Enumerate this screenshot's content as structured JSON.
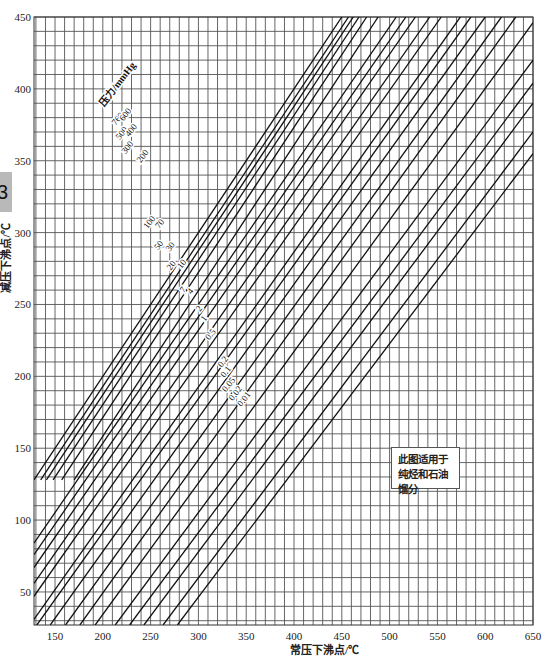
{
  "side_tab": {
    "label": "3"
  },
  "chart_data": {
    "type": "line",
    "title": "",
    "xlabel": "常压下沸点/℃",
    "ylabel": "减压下沸点/℃",
    "xlim": [
      128,
      650
    ],
    "ylim": [
      27,
      450
    ],
    "x_ticks": [
      150,
      200,
      250,
      300,
      350,
      400,
      450,
      500,
      550,
      600,
      650
    ],
    "y_ticks": [
      50,
      100,
      150,
      200,
      250,
      300,
      350,
      400,
      450
    ],
    "grid": {
      "on": true,
      "minor_step_x": 10,
      "minor_step_y": 10
    },
    "legend_title": "压力/mmHg",
    "note": "此图适用于纯烃和石油馏分",
    "series": [
      {
        "name": "760",
        "points": [
          [
            128,
            128
          ],
          [
            450,
            450
          ]
        ]
      },
      {
        "name": "600",
        "points": [
          [
            135,
            128
          ],
          [
            457,
            450
          ]
        ]
      },
      {
        "name": "500",
        "points": [
          [
            141,
            128
          ],
          [
            462,
            450
          ]
        ]
      },
      {
        "name": "400",
        "points": [
          [
            148,
            128
          ],
          [
            468,
            450
          ]
        ]
      },
      {
        "name": "300",
        "points": [
          [
            157,
            128
          ],
          [
            476,
            450
          ]
        ]
      },
      {
        "name": "200",
        "points": [
          [
            170,
            128
          ],
          [
            488,
            450
          ]
        ]
      },
      {
        "name": "100",
        "points": [
          [
            128,
            84
          ],
          [
            507,
            450
          ]
        ]
      },
      {
        "name": "70",
        "points": [
          [
            128,
            76
          ],
          [
            517,
            450
          ]
        ]
      },
      {
        "name": "50",
        "points": [
          [
            128,
            67
          ],
          [
            527,
            450
          ]
        ]
      },
      {
        "name": "30",
        "points": [
          [
            128,
            56
          ],
          [
            542,
            450
          ]
        ]
      },
      {
        "name": "20",
        "points": [
          [
            128,
            47
          ],
          [
            554,
            450
          ]
        ]
      },
      {
        "name": "10",
        "points": [
          [
            128,
            31
          ],
          [
            574,
            450
          ]
        ]
      },
      {
        "name": "7",
        "points": [
          [
            131,
            27
          ],
          [
            585,
            450
          ]
        ]
      },
      {
        "name": "4",
        "points": [
          [
            145,
            27
          ],
          [
            600,
            450
          ]
        ]
      },
      {
        "name": "2",
        "points": [
          [
            161,
            27
          ],
          [
            617,
            450
          ]
        ]
      },
      {
        "name": "1",
        "points": [
          [
            176,
            27
          ],
          [
            632,
            450
          ]
        ]
      },
      {
        "name": "0.5",
        "points": [
          [
            192,
            27
          ],
          [
            650,
            446
          ]
        ]
      },
      {
        "name": "0.2",
        "points": [
          [
            213,
            27
          ],
          [
            650,
            420
          ]
        ]
      },
      {
        "name": "0.1",
        "points": [
          [
            228,
            27
          ],
          [
            650,
            404
          ]
        ]
      },
      {
        "name": "0.05",
        "points": [
          [
            243,
            27
          ],
          [
            650,
            390
          ]
        ]
      },
      {
        "name": "0.02",
        "points": [
          [
            263,
            27
          ],
          [
            650,
            370
          ]
        ]
      },
      {
        "name": "0.01",
        "points": [
          [
            278,
            27
          ],
          [
            650,
            355
          ]
        ]
      }
    ],
    "label_positions": [
      {
        "text": "760",
        "x": 218,
        "y": 378
      },
      {
        "text": "600",
        "x": 226,
        "y": 381
      },
      {
        "text": "500",
        "x": 222,
        "y": 368
      },
      {
        "text": "400",
        "x": 232,
        "y": 370
      },
      {
        "text": "300",
        "x": 228,
        "y": 358
      },
      {
        "text": "200",
        "x": 244,
        "y": 352
      },
      {
        "text": "100",
        "x": 251,
        "y": 306
      },
      {
        "text": "70",
        "x": 262,
        "y": 305
      },
      {
        "text": "50",
        "x": 261,
        "y": 290
      },
      {
        "text": "30",
        "x": 273,
        "y": 289
      },
      {
        "text": "20",
        "x": 274,
        "y": 276
      },
      {
        "text": "10",
        "x": 285,
        "y": 277
      },
      {
        "text": "7",
        "x": 286,
        "y": 259
      },
      {
        "text": "4",
        "x": 294,
        "y": 258
      },
      {
        "text": "2",
        "x": 303,
        "y": 246
      },
      {
        "text": "1",
        "x": 308,
        "y": 239
      },
      {
        "text": "0.5",
        "x": 315,
        "y": 228
      },
      {
        "text": "0.2",
        "x": 328,
        "y": 209
      },
      {
        "text": "0.1",
        "x": 331,
        "y": 202
      },
      {
        "text": "0.05",
        "x": 334,
        "y": 193
      },
      {
        "text": "0.02",
        "x": 341,
        "y": 187
      },
      {
        "text": "0.01",
        "x": 350,
        "y": 183
      }
    ]
  }
}
